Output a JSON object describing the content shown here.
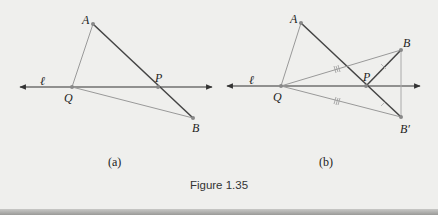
{
  "figure": {
    "caption": "Figure 1.35",
    "colors": {
      "background": "#efefed",
      "dark_line": "#444444",
      "light_line": "#9a9a9a",
      "point": "#8a8a8a",
      "text": "#222222"
    },
    "panels": [
      {
        "label": "(a)",
        "line_label": "ℓ",
        "points": {
          "A": {
            "label": "A",
            "x": 93,
            "y": 24
          },
          "Q": {
            "label": "Q",
            "x": 72,
            "y": 87
          },
          "P": {
            "label": "P",
            "x": 158,
            "y": 87
          },
          "B": {
            "label": "B",
            "x": 193,
            "y": 118
          }
        },
        "segments": [
          "AQ",
          "AB",
          "QB"
        ],
        "line": {
          "x1": 20,
          "x2": 212,
          "y": 87
        }
      },
      {
        "label": "(b)",
        "line_label": "ℓ",
        "points": {
          "A": {
            "label": "A",
            "x": 301,
            "y": 23
          },
          "Q": {
            "label": "Q",
            "x": 281,
            "y": 86
          },
          "P": {
            "label": "P",
            "x": 366,
            "y": 86
          },
          "B": {
            "label": "B",
            "x": 401,
            "y": 50
          },
          "B_prime": {
            "label": "B′",
            "x": 401,
            "y": 117
          }
        },
        "segments": [
          "AQ",
          "AB′",
          "QB",
          "QB′",
          "PB",
          "BB′"
        ],
        "congruence_marks": [
          "QB ≅ QB′ (triple tick)",
          "PB ≅ PB′ (single tick)"
        ],
        "line": {
          "x1": 227,
          "x2": 420,
          "y": 86
        }
      }
    ]
  }
}
